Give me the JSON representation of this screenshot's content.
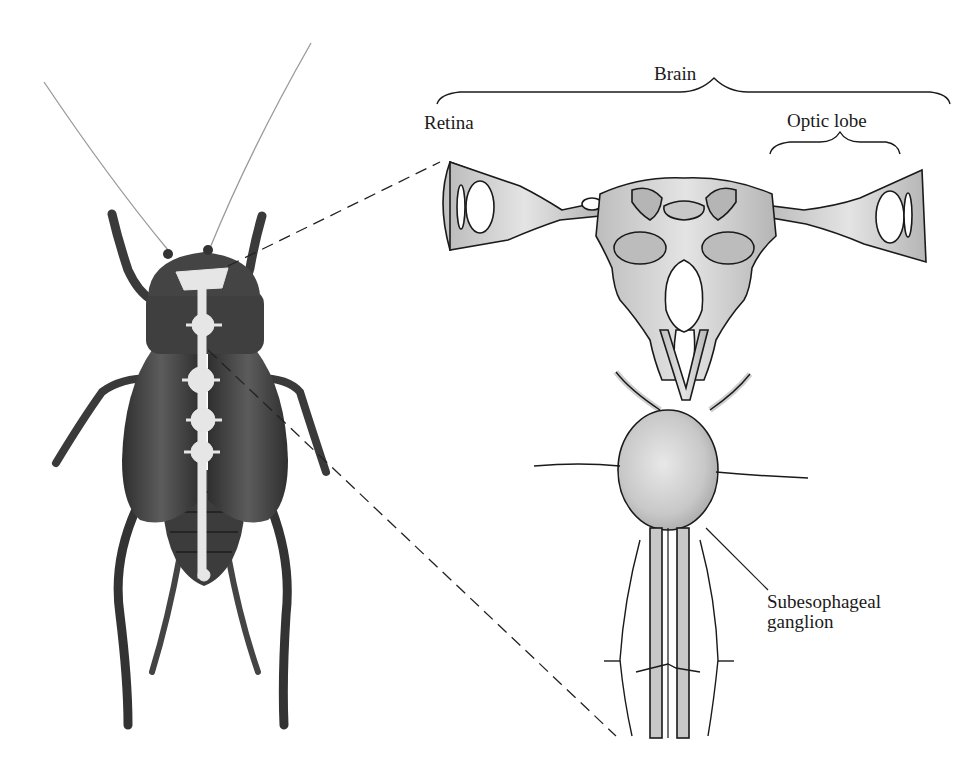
{
  "figure": {
    "labels": {
      "brain": "Brain",
      "retina": "Retina",
      "optic_lobe": "Optic lobe",
      "subesophageal_line1": "Subesophageal",
      "subesophageal_line2": "ganglion"
    },
    "colors": {
      "background": "#ffffff",
      "insect_body": "#4a4a4a",
      "nerve_cord_highlight": "#e6e6e6",
      "brain_fill": "#cfcfcf",
      "outline": "#1a1a1a"
    }
  }
}
